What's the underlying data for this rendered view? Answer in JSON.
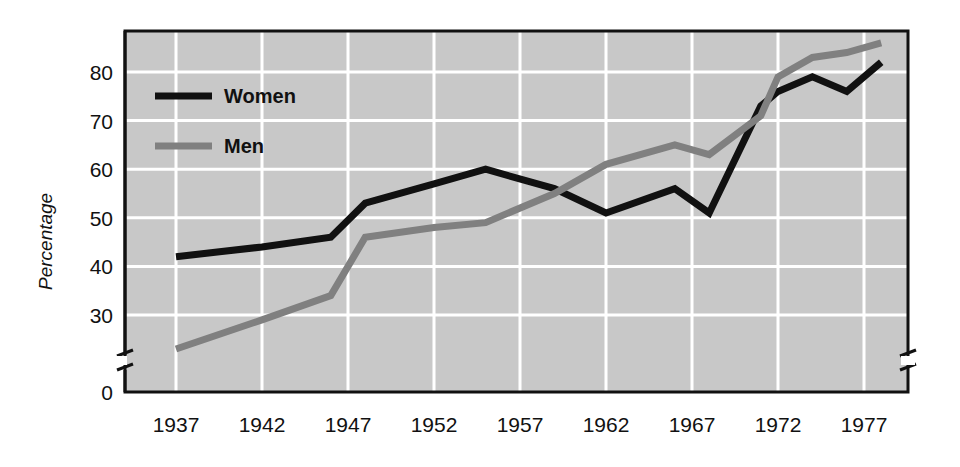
{
  "chart_data": {
    "type": "line",
    "title": "",
    "xlabel": "",
    "ylabel": "Percentage",
    "xlim": [
      1935,
      1980
    ],
    "ylim": [
      22,
      88
    ],
    "y_axis_break": true,
    "y_break_between": [
      0,
      26
    ],
    "grid": true,
    "grid_color": "#ffffff",
    "plot_background": "#c8c8c8",
    "legend_position": "top-left-inside",
    "x_tick_labels": [
      "1937",
      "1942",
      "1947",
      "1952",
      "1957",
      "1962",
      "1967",
      "1972",
      "1977"
    ],
    "x_tick_values": [
      1937,
      1942,
      1947,
      1952,
      1957,
      1962,
      1967,
      1972,
      1977
    ],
    "y_tick_labels": [
      "0",
      "30",
      "40",
      "50",
      "60",
      "70",
      "80"
    ],
    "y_tick_values": [
      0,
      30,
      40,
      50,
      60,
      70,
      80
    ],
    "series": [
      {
        "name": "Women",
        "color": "#111111",
        "x": [
          1937,
          1942,
          1946,
          1948,
          1952,
          1955,
          1959,
          1962,
          1966,
          1968,
          1971,
          1972,
          1974,
          1976,
          1978
        ],
        "values": [
          42,
          44,
          46,
          53,
          57,
          60,
          56,
          51,
          56,
          51,
          73,
          76,
          79,
          76,
          82
        ]
      },
      {
        "name": "Men",
        "color": "#808080",
        "x": [
          1937,
          1942,
          1946,
          1948,
          1952,
          1955,
          1959,
          1962,
          1966,
          1968,
          1971,
          1972,
          1974,
          1976,
          1978
        ],
        "values": [
          23,
          29,
          34,
          46,
          48,
          49,
          55,
          61,
          65,
          63,
          71,
          79,
          83,
          84,
          86
        ]
      }
    ]
  },
  "legend": {
    "items": [
      {
        "label": "Women",
        "color": "#111111",
        "weight": "thick"
      },
      {
        "label": "Men",
        "color": "#808080",
        "weight": "thick"
      }
    ]
  },
  "axes": {
    "y_title": "Percentage"
  }
}
